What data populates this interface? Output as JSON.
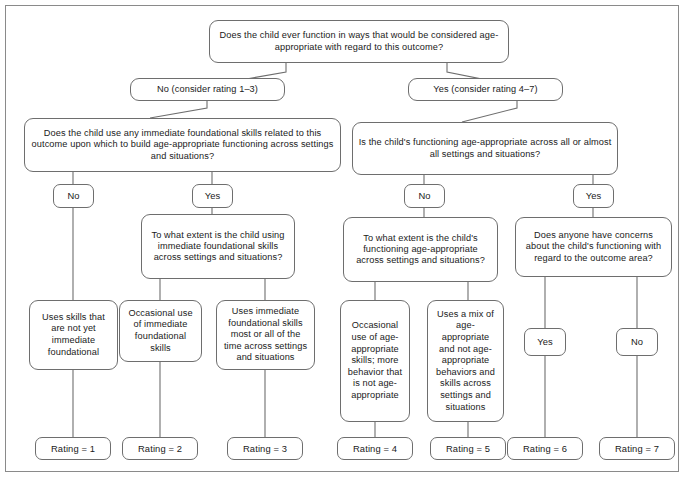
{
  "diagram": {
    "title_question": "Does the child ever function in ways that would be considered age-appropriate with regard to this outcome?",
    "branch_no": "No (consider rating 1–3)",
    "branch_yes": "Yes (consider rating 4–7)",
    "q_left": "Does the child use any immediate foundational skills related to this outcome upon which to build age-appropriate functioning across settings and situations?",
    "q_right": "Is the child's functioning age-appropriate across all or almost all settings and situations?",
    "left_no": "No",
    "left_yes": "Yes",
    "right_no": "No",
    "right_yes": "Yes",
    "q_left_yes": "To what extent is the child using immediate foundational skills across settings and situations?",
    "q_right_no": "To what extent is the child's functioning age-appropriate across settings and situations?",
    "q_right_yes": "Does anyone have concerns about the child's functioning with regard to the outcome area?",
    "desc_1": "Uses skills that are not yet immediate foundational",
    "desc_2": "Occasional use of immediate foundational skills",
    "desc_3": "Uses immediate foundational skills most or all of the time across settings and situations",
    "desc_4": "Occasional use of age-appropriate skills; more behavior that is not age-appropriate",
    "desc_5": "Uses a mix of age-appropriate and not age-appropriate behaviors and skills across settings and situations",
    "concern_yes": "Yes",
    "concern_no": "No",
    "rating_1": "Rating = 1",
    "rating_2": "Rating = 2",
    "rating_3": "Rating = 3",
    "rating_4": "Rating = 4",
    "rating_5": "Rating = 5",
    "rating_6": "Rating = 6",
    "rating_7": "Rating = 7",
    "colors": {
      "border": "#6e6e6e",
      "frame": "#8a8a8a",
      "text": "#1a1a1a",
      "background": "#ffffff"
    }
  }
}
